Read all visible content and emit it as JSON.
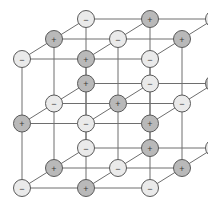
{
  "figure": {
    "caption": "",
    "background_color": "#ffffff",
    "line_color": "#6e6e6e",
    "cation_fill": "#b9b9b9",
    "anion_fill": "#eaeaea",
    "ion_outline": "#5a5a5a",
    "sign_color": "#3a3a3a"
  },
  "lattice": {
    "type": "rock-salt",
    "dimensions": [
      3,
      3,
      3
    ],
    "ion_count": 27,
    "radius": 8.5,
    "origin": {
      "x": 22,
      "y": 188
    },
    "step_x": 64,
    "step_y": -64.5,
    "depth_dx": 32,
    "depth_dy": -20,
    "cation_label": "+",
    "anion_label": "−",
    "ions": [
      {
        "i": 0,
        "j": 0,
        "k": 0,
        "sign": "−",
        "kind": "anion"
      },
      {
        "i": 1,
        "j": 0,
        "k": 0,
        "sign": "+",
        "kind": "cation"
      },
      {
        "i": 2,
        "j": 0,
        "k": 0,
        "sign": "−",
        "kind": "anion"
      },
      {
        "i": 0,
        "j": 1,
        "k": 0,
        "sign": "+",
        "kind": "cation"
      },
      {
        "i": 1,
        "j": 1,
        "k": 0,
        "sign": "−",
        "kind": "anion"
      },
      {
        "i": 2,
        "j": 1,
        "k": 0,
        "sign": "+",
        "kind": "cation"
      },
      {
        "i": 0,
        "j": 2,
        "k": 0,
        "sign": "−",
        "kind": "anion"
      },
      {
        "i": 1,
        "j": 2,
        "k": 0,
        "sign": "+",
        "kind": "cation"
      },
      {
        "i": 2,
        "j": 2,
        "k": 0,
        "sign": "−",
        "kind": "anion"
      },
      {
        "i": 0,
        "j": 0,
        "k": 1,
        "sign": "+",
        "kind": "cation"
      },
      {
        "i": 1,
        "j": 0,
        "k": 1,
        "sign": "−",
        "kind": "anion"
      },
      {
        "i": 2,
        "j": 0,
        "k": 1,
        "sign": "+",
        "kind": "cation"
      },
      {
        "i": 0,
        "j": 1,
        "k": 1,
        "sign": "−",
        "kind": "anion"
      },
      {
        "i": 1,
        "j": 1,
        "k": 1,
        "sign": "+",
        "kind": "cation"
      },
      {
        "i": 2,
        "j": 1,
        "k": 1,
        "sign": "−",
        "kind": "anion"
      },
      {
        "i": 0,
        "j": 2,
        "k": 1,
        "sign": "+",
        "kind": "cation"
      },
      {
        "i": 1,
        "j": 2,
        "k": 1,
        "sign": "−",
        "kind": "anion"
      },
      {
        "i": 2,
        "j": 2,
        "k": 1,
        "sign": "+",
        "kind": "cation"
      },
      {
        "i": 0,
        "j": 0,
        "k": 2,
        "sign": "−",
        "kind": "anion"
      },
      {
        "i": 1,
        "j": 0,
        "k": 2,
        "sign": "+",
        "kind": "cation"
      },
      {
        "i": 2,
        "j": 0,
        "k": 2,
        "sign": "−",
        "kind": "anion"
      },
      {
        "i": 0,
        "j": 1,
        "k": 2,
        "sign": "+",
        "kind": "cation"
      },
      {
        "i": 1,
        "j": 1,
        "k": 2,
        "sign": "−",
        "kind": "anion"
      },
      {
        "i": 2,
        "j": 1,
        "k": 2,
        "sign": "+",
        "kind": "cation"
      },
      {
        "i": 0,
        "j": 2,
        "k": 2,
        "sign": "−",
        "kind": "anion"
      },
      {
        "i": 1,
        "j": 2,
        "k": 2,
        "sign": "+",
        "kind": "cation"
      },
      {
        "i": 2,
        "j": 2,
        "k": 2,
        "sign": "−",
        "kind": "anion"
      }
    ]
  }
}
